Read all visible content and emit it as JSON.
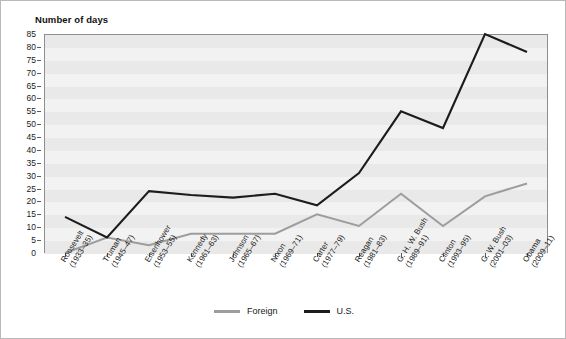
{
  "figure": {
    "axis_title": "Number of days",
    "background_color": "#ffffff",
    "plot_background_color": "#f2f2f2",
    "band_color": "#e9e9e9"
  },
  "legend": {
    "position": "bottom-center",
    "items": [
      {
        "label": "Foreign",
        "color": "#9d9d9d"
      },
      {
        "label": "U.S.",
        "color": "#1c1c1c"
      }
    ]
  },
  "chart_data": {
    "type": "line",
    "title": "",
    "subtitle": "",
    "xlabel": "",
    "ylabel": "Number of days",
    "ylim": [
      0,
      85
    ],
    "ytick_step": 5,
    "yticks": [
      0,
      5,
      10,
      15,
      20,
      25,
      30,
      35,
      40,
      45,
      50,
      55,
      60,
      65,
      70,
      75,
      80,
      85
    ],
    "grid": true,
    "legend_position": "bottom-center",
    "categories": [
      "Roosevelt (1933–35)",
      "Truman (1945–47)",
      "Eisenhower (1953–55)",
      "Kennedy (1961–63)",
      "Johnson (1965–67)",
      "Nixon (1969–71)",
      "Carter (1977–79)",
      "Reagan (1981–83)",
      "G. H. W. Bush (1989–91)",
      "Clinton (1993–95)",
      "G. W. Bush (2001–03)",
      "Obama (2009–11)"
    ],
    "category_lines": [
      [
        "Roosevelt",
        "(1933–35)"
      ],
      [
        "Truman",
        "(1945–47)"
      ],
      [
        "Eisenhower",
        "(1953–55)"
      ],
      [
        "Kennedy",
        "(1961–63)"
      ],
      [
        "Johnson",
        "(1965–67)"
      ],
      [
        "Nixon",
        "(1969–71)"
      ],
      [
        "Carter",
        "(1977–79)"
      ],
      [
        "Reagan",
        "(1981–83)"
      ],
      [
        "G. H. W. Bush",
        "(1989–91)"
      ],
      [
        "Clinton",
        "(1993–95)"
      ],
      [
        "G. W. Bush",
        "(2001–03)"
      ],
      [
        "Obama",
        "(2009–11)"
      ]
    ],
    "series": [
      {
        "name": "Foreign",
        "color": "#9d9d9d",
        "values": [
          0,
          6,
          3,
          7.5,
          7.5,
          7.5,
          15,
          10.5,
          23,
          10.5,
          22,
          27
        ]
      },
      {
        "name": "U.S.",
        "color": "#1c1c1c",
        "values": [
          14,
          6,
          24,
          22.5,
          21.5,
          23,
          18.5,
          31,
          55,
          48.5,
          85,
          78
        ]
      }
    ]
  }
}
